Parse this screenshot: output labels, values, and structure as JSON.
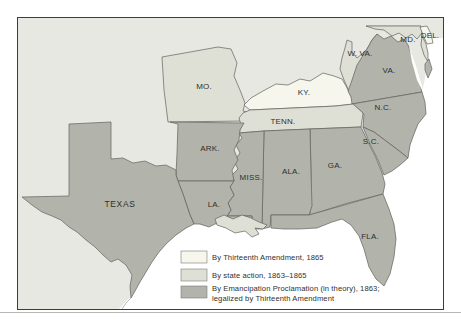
{
  "colors": {
    "thirteenth_amendment": "#f6f6ec",
    "state_action": "#dfe0d5",
    "emancipation": "#b2b4ab",
    "background_land": "#e7e8e2",
    "water": "#ffffff"
  },
  "legend": {
    "items": [
      {
        "label": "By Thirteenth Amendment, 1865",
        "color": "#f6f6ec"
      },
      {
        "label": "By state action, 1863–1865",
        "color": "#dfe0d5"
      },
      {
        "label_line1": "By Emancipation Proclamation (in theory), 1863;",
        "label_line2": "legalized by Thirteenth Amendment",
        "color": "#b2b4ab"
      }
    ]
  },
  "states": [
    {
      "label": "MO.",
      "category": "state_action"
    },
    {
      "label": "KY.",
      "category": "thirteenth_amendment"
    },
    {
      "label": "W. VA.",
      "category": "state_action"
    },
    {
      "label": "MD.",
      "category": "state_action"
    },
    {
      "label": "DEL.",
      "category": "thirteenth_amendment"
    },
    {
      "label": "VA.",
      "category": "emancipation"
    },
    {
      "label": "N.C.",
      "category": "emancipation"
    },
    {
      "label": "TENN.",
      "category": "state_action"
    },
    {
      "label": "ARK.",
      "category": "emancipation"
    },
    {
      "label": "S.C.",
      "category": "emancipation"
    },
    {
      "label": "MISS.",
      "category": "emancipation"
    },
    {
      "label": "ALA.",
      "category": "emancipation"
    },
    {
      "label": "GA.",
      "category": "emancipation"
    },
    {
      "label": "TEXAS",
      "category": "emancipation"
    },
    {
      "label": "LA.",
      "category": "emancipation"
    },
    {
      "label": "FLA.",
      "category": "emancipation"
    }
  ]
}
